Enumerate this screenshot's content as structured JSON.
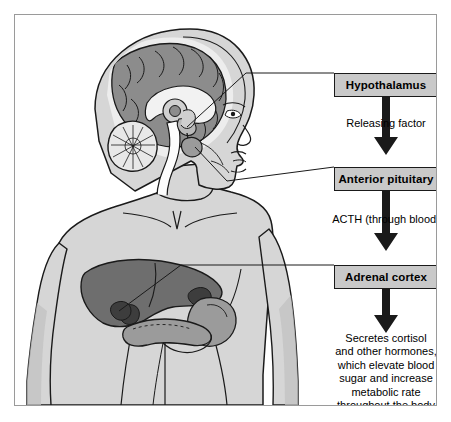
{
  "flow": {
    "boxes": [
      {
        "id": "hypothalamus",
        "label": "Hypothalamus"
      },
      {
        "id": "anterior-pituitary",
        "label": "Anterior pituitary"
      },
      {
        "id": "adrenal-cortex",
        "label": "Adrenal cortex"
      }
    ],
    "captions": [
      {
        "id": "releasing-factor",
        "label": "Releasing factor"
      },
      {
        "id": "acth",
        "label": "ACTH (through blood)"
      }
    ],
    "outcome_lines": [
      "Secretes cortisol",
      "and other hormones,",
      "which elevate blood",
      "sugar and increase",
      "metabolic rate",
      "throughout the body"
    ]
  },
  "anatomy": {
    "labels_linked": [
      {
        "structure": "hypothalamus",
        "links_to": "Hypothalamus"
      },
      {
        "structure": "anterior-pituitary",
        "links_to": "Anterior pituitary"
      },
      {
        "structure": "adrenal-gland",
        "links_to": "Adrenal cortex"
      }
    ],
    "parts": [
      "cerebrum",
      "corpus callosum",
      "cerebellum",
      "brainstem",
      "hypothalamus",
      "pituitary gland",
      "liver",
      "stomach",
      "pancreas",
      "adrenal glands"
    ]
  },
  "colors": {
    "frame_border": "#9a9a9a",
    "page_background": "#ffffff",
    "box_fill": "#c9c9c9",
    "box_border": "#1a1a1a",
    "arrow": "#1a1a1a",
    "skin": "#d6d6d6",
    "skin_shadow": "#c2c2c2",
    "brain_cortex": "#8c8c8c",
    "brain_light": "#ededed",
    "liver": "#6e6e6e",
    "organ_mid": "#9b9b9b",
    "organ_dark": "#3d3d3d",
    "outline": "#1a1a1a",
    "text": "#000000"
  }
}
